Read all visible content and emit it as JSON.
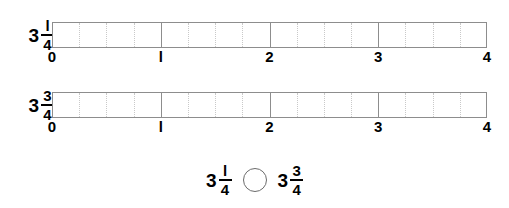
{
  "page": {
    "type": "fraction-comparison-number-line-worksheet",
    "background_color": "#ffffff",
    "ink_color": "#000000",
    "bar_border_color": "#8d8d8d",
    "subdivision_color": "#c9c9c9",
    "circle_color": "#6b6b6b"
  },
  "number_lines": [
    {
      "label": {
        "whole": "3",
        "numerator": "l",
        "denominator": "4"
      },
      "axis_labels": [
        "0",
        "l",
        "2",
        "3",
        "4"
      ],
      "whole_units": 4,
      "subdivisions_per_unit": 4
    },
    {
      "label": {
        "whole": "3",
        "numerator": "3",
        "denominator": "4"
      },
      "axis_labels": [
        "0",
        "l",
        "2",
        "3",
        "4"
      ],
      "whole_units": 4,
      "subdivisions_per_unit": 4
    }
  ],
  "comparison": {
    "left": {
      "whole": "3",
      "numerator": "l",
      "denominator": "4"
    },
    "operator": "",
    "right": {
      "whole": "3",
      "numerator": "3",
      "denominator": "4"
    }
  },
  "chart_data": {
    "type": "bar",
    "title": "",
    "xlabel": "",
    "ylabel": "",
    "categories": [
      "3 1/4",
      "3 3/4"
    ],
    "values": [
      3.25,
      3.75
    ],
    "xlim": [
      0,
      4
    ],
    "tick_labels": [
      "0",
      "1",
      "2",
      "3",
      "4"
    ],
    "minor_ticks_per_unit": 4,
    "grid": true,
    "legend": "none"
  }
}
